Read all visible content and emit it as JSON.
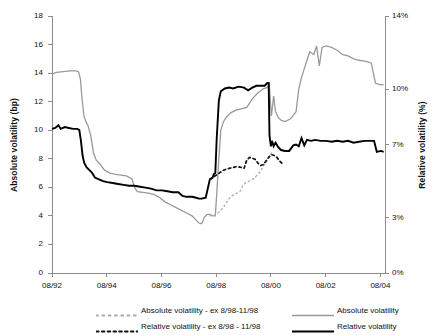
{
  "chart_data": {
    "type": "line",
    "title": "",
    "xlabel": "",
    "ylabel": "Absolute volatility (bp)",
    "y2label": "Relative volatility (%)",
    "grid": false,
    "legend_position": "bottom",
    "x_tick_labels": [
      "08/92",
      "08/94",
      "08/96",
      "08/98",
      "08/00",
      "08/02",
      "08/04"
    ],
    "x_tick_values": [
      1992.583,
      1994.583,
      1996.583,
      1998.583,
      2000.583,
      2002.583,
      2004.583
    ],
    "xlim": [
      1992.583,
      2004.75
    ],
    "y_left_tick_labels": [
      "0",
      "2",
      "4",
      "6",
      "8",
      "10",
      "12",
      "14",
      "16",
      "18"
    ],
    "y_left_tick_values": [
      0,
      2,
      4,
      6,
      8,
      10,
      12,
      14,
      16,
      18
    ],
    "ylim": [
      0,
      18
    ],
    "y_right_tick_labels": [
      "0%",
      "3%",
      "7%",
      "10%",
      "14%"
    ],
    "y_right_tick_values": [
      0,
      3,
      7,
      10,
      14
    ],
    "y2lim": [
      0,
      14
    ],
    "series": [
      {
        "name": "Absolute volatility",
        "axis": "left",
        "color": "#999999",
        "style": "solid",
        "width": 1.3,
        "points": [
          [
            1992.583,
            13.95
          ],
          [
            1992.75,
            14.05
          ],
          [
            1993.0,
            14.1
          ],
          [
            1993.25,
            14.15
          ],
          [
            1993.45,
            14.15
          ],
          [
            1993.55,
            14.1
          ],
          [
            1993.62,
            13.6
          ],
          [
            1993.68,
            12.2
          ],
          [
            1993.75,
            11.0
          ],
          [
            1993.82,
            10.6
          ],
          [
            1993.9,
            10.3
          ],
          [
            1994.0,
            9.6
          ],
          [
            1994.1,
            8.4
          ],
          [
            1994.2,
            7.9
          ],
          [
            1994.35,
            7.6
          ],
          [
            1994.5,
            7.2
          ],
          [
            1994.7,
            7.0
          ],
          [
            1994.9,
            6.9
          ],
          [
            1995.1,
            6.85
          ],
          [
            1995.3,
            6.8
          ],
          [
            1995.5,
            6.6
          ],
          [
            1995.6,
            6.0
          ],
          [
            1995.7,
            5.7
          ],
          [
            1995.9,
            5.65
          ],
          [
            1996.1,
            5.6
          ],
          [
            1996.3,
            5.5
          ],
          [
            1996.5,
            5.3
          ],
          [
            1996.7,
            5.0
          ],
          [
            1996.9,
            4.8
          ],
          [
            1997.1,
            4.6
          ],
          [
            1997.3,
            4.4
          ],
          [
            1997.5,
            4.2
          ],
          [
            1997.7,
            4.0
          ],
          [
            1997.85,
            3.7
          ],
          [
            1997.95,
            3.5
          ],
          [
            1998.05,
            3.45
          ],
          [
            1998.15,
            3.9
          ],
          [
            1998.25,
            4.1
          ],
          [
            1998.35,
            4.1
          ],
          [
            1998.45,
            4.0
          ],
          [
            1998.55,
            4.0
          ],
          [
            1998.6,
            5.5
          ],
          [
            1998.68,
            8.0
          ],
          [
            1998.75,
            10.0
          ],
          [
            1998.85,
            10.6
          ],
          [
            1998.95,
            10.9
          ],
          [
            1999.1,
            11.2
          ],
          [
            1999.3,
            11.4
          ],
          [
            1999.5,
            11.5
          ],
          [
            1999.7,
            11.6
          ],
          [
            1999.9,
            12.2
          ],
          [
            2000.1,
            12.6
          ],
          [
            2000.3,
            12.9
          ],
          [
            2000.45,
            13.0
          ],
          [
            2000.52,
            13.2
          ],
          [
            2000.6,
            11.0
          ],
          [
            2000.68,
            12.4
          ],
          [
            2000.75,
            11.3
          ],
          [
            2000.85,
            10.9
          ],
          [
            2000.95,
            10.7
          ],
          [
            2001.1,
            10.6
          ],
          [
            2001.3,
            10.8
          ],
          [
            2001.5,
            11.3
          ],
          [
            2001.6,
            12.9
          ],
          [
            2001.7,
            13.7
          ],
          [
            2001.85,
            14.6
          ],
          [
            2002.0,
            15.5
          ],
          [
            2002.15,
            15.3
          ],
          [
            2002.25,
            15.9
          ],
          [
            2002.35,
            14.5
          ],
          [
            2002.45,
            15.8
          ],
          [
            2002.6,
            15.9
          ],
          [
            2002.8,
            15.8
          ],
          [
            2003.0,
            15.6
          ],
          [
            2003.2,
            15.3
          ],
          [
            2003.4,
            15.2
          ],
          [
            2003.6,
            15.0
          ],
          [
            2003.8,
            14.9
          ],
          [
            2003.95,
            14.85
          ],
          [
            2004.1,
            14.8
          ],
          [
            2004.25,
            14.7
          ],
          [
            2004.4,
            13.3
          ],
          [
            2004.55,
            13.2
          ],
          [
            2004.7,
            13.2
          ]
        ]
      },
      {
        "name": "Relative volatility",
        "axis": "right",
        "color": "#000000",
        "style": "solid",
        "width": 1.9,
        "points": [
          [
            1992.583,
            7.85
          ],
          [
            1992.7,
            7.9
          ],
          [
            1992.82,
            8.05
          ],
          [
            1992.9,
            7.85
          ],
          [
            1993.05,
            7.95
          ],
          [
            1993.2,
            7.9
          ],
          [
            1993.35,
            7.85
          ],
          [
            1993.5,
            7.85
          ],
          [
            1993.58,
            7.8
          ],
          [
            1993.64,
            7.2
          ],
          [
            1993.7,
            6.4
          ],
          [
            1993.76,
            6.0
          ],
          [
            1993.85,
            5.75
          ],
          [
            1993.95,
            5.6
          ],
          [
            1994.05,
            5.45
          ],
          [
            1994.15,
            5.2
          ],
          [
            1994.3,
            5.1
          ],
          [
            1994.45,
            5.0
          ],
          [
            1994.6,
            4.95
          ],
          [
            1994.8,
            4.9
          ],
          [
            1995.0,
            4.85
          ],
          [
            1995.2,
            4.8
          ],
          [
            1995.4,
            4.75
          ],
          [
            1995.6,
            4.75
          ],
          [
            1995.8,
            4.7
          ],
          [
            1996.0,
            4.65
          ],
          [
            1996.2,
            4.6
          ],
          [
            1996.4,
            4.5
          ],
          [
            1996.6,
            4.5
          ],
          [
            1996.8,
            4.45
          ],
          [
            1997.0,
            4.4
          ],
          [
            1997.2,
            4.4
          ],
          [
            1997.35,
            4.2
          ],
          [
            1997.5,
            4.15
          ],
          [
            1997.7,
            4.15
          ],
          [
            1997.85,
            4.1
          ],
          [
            1997.95,
            4.05
          ],
          [
            1998.05,
            4.05
          ],
          [
            1998.2,
            4.1
          ],
          [
            1998.35,
            5.1
          ],
          [
            1998.45,
            5.2
          ],
          [
            1998.5,
            5.4
          ],
          [
            1998.55,
            5.45
          ],
          [
            1998.6,
            7.3
          ],
          [
            1998.68,
            9.4
          ],
          [
            1998.75,
            9.9
          ],
          [
            1998.9,
            10.05
          ],
          [
            1999.05,
            10.1
          ],
          [
            1999.2,
            10.05
          ],
          [
            1999.4,
            10.15
          ],
          [
            1999.6,
            10.1
          ],
          [
            1999.75,
            9.95
          ],
          [
            1999.9,
            10.1
          ],
          [
            2000.05,
            10.2
          ],
          [
            2000.2,
            10.2
          ],
          [
            2000.35,
            10.2
          ],
          [
            2000.45,
            10.35
          ],
          [
            2000.5,
            10.35
          ],
          [
            2000.53,
            7.5
          ],
          [
            2000.58,
            6.9
          ],
          [
            2000.62,
            7.2
          ],
          [
            2000.68,
            6.9
          ],
          [
            2000.75,
            7.1
          ],
          [
            2000.85,
            6.85
          ],
          [
            2000.95,
            6.7
          ],
          [
            2001.1,
            6.65
          ],
          [
            2001.25,
            6.65
          ],
          [
            2001.4,
            6.95
          ],
          [
            2001.5,
            7.0
          ],
          [
            2001.6,
            6.9
          ],
          [
            2001.7,
            7.35
          ],
          [
            2001.8,
            6.95
          ],
          [
            2001.9,
            7.25
          ],
          [
            2002.05,
            7.2
          ],
          [
            2002.2,
            7.25
          ],
          [
            2002.4,
            7.2
          ],
          [
            2002.6,
            7.2
          ],
          [
            2002.8,
            7.15
          ],
          [
            2003.0,
            7.2
          ],
          [
            2003.2,
            7.15
          ],
          [
            2003.4,
            7.2
          ],
          [
            2003.6,
            7.1
          ],
          [
            2003.8,
            7.15
          ],
          [
            2004.0,
            7.2
          ],
          [
            2004.2,
            7.2
          ],
          [
            2004.35,
            7.2
          ],
          [
            2004.45,
            6.6
          ],
          [
            2004.6,
            6.65
          ],
          [
            2004.7,
            6.6
          ]
        ]
      },
      {
        "name": "Absolute volatility - ex 8/98-11/98",
        "axis": "left",
        "color": "#aaaaaa",
        "style": "dotted",
        "width": 1.3,
        "points": [
          [
            1998.35,
            4.0
          ],
          [
            1998.45,
            4.05
          ],
          [
            1998.55,
            4.05
          ],
          [
            1998.65,
            4.2
          ],
          [
            1998.75,
            4.4
          ],
          [
            1998.85,
            4.6
          ],
          [
            1998.95,
            4.9
          ],
          [
            1999.05,
            5.2
          ],
          [
            1999.15,
            5.4
          ],
          [
            1999.25,
            5.5
          ],
          [
            1999.35,
            5.6
          ],
          [
            1999.45,
            5.7
          ],
          [
            1999.55,
            6.1
          ],
          [
            1999.65,
            6.3
          ],
          [
            1999.75,
            6.4
          ],
          [
            1999.85,
            6.5
          ],
          [
            1999.95,
            6.6
          ],
          [
            2000.05,
            6.8
          ],
          [
            2000.15,
            7.0
          ],
          [
            2000.25,
            7.3
          ],
          [
            2000.35,
            7.6
          ],
          [
            2000.45,
            7.9
          ],
          [
            2000.52,
            8.2
          ],
          [
            2000.6,
            8.4
          ]
        ]
      },
      {
        "name": "Relative volatility - ex 8/98 - 11/98",
        "axis": "right",
        "color": "#111111",
        "style": "dashed",
        "width": 1.7,
        "points": [
          [
            1998.35,
            5.1
          ],
          [
            1998.45,
            5.2
          ],
          [
            1998.55,
            5.3
          ],
          [
            1998.65,
            5.4
          ],
          [
            1998.75,
            5.5
          ],
          [
            1998.85,
            5.6
          ],
          [
            1998.95,
            5.65
          ],
          [
            1999.05,
            5.7
          ],
          [
            1999.2,
            5.75
          ],
          [
            1999.35,
            5.8
          ],
          [
            1999.5,
            5.75
          ],
          [
            1999.6,
            5.7
          ],
          [
            1999.7,
            6.15
          ],
          [
            1999.8,
            6.3
          ],
          [
            1999.9,
            6.25
          ],
          [
            2000.0,
            6.2
          ],
          [
            2000.1,
            6.0
          ],
          [
            2000.2,
            5.85
          ],
          [
            2000.3,
            5.9
          ],
          [
            2000.4,
            6.1
          ],
          [
            2000.5,
            6.3
          ],
          [
            2000.6,
            6.45
          ],
          [
            2000.7,
            6.4
          ],
          [
            2000.8,
            6.3
          ],
          [
            2000.9,
            6.1
          ],
          [
            2001.0,
            5.95
          ]
        ]
      }
    ]
  },
  "axes": {
    "left_title": "Absolute volatility (bp)",
    "right_title": "Relative volatility (%)"
  },
  "legend": {
    "items": [
      {
        "label": "Absolute volatility - ex 8/98-11/98",
        "style": "dotted",
        "color": "#aaaaaa",
        "row": 0,
        "col": 0
      },
      {
        "label": "Absolute volatility",
        "style": "solid",
        "color": "#999999",
        "row": 0,
        "col": 1
      },
      {
        "label": "Relative volatility - ex 8/98 - 11/98",
        "style": "dashed",
        "color": "#111111",
        "row": 1,
        "col": 0
      },
      {
        "label": "Relative volatility",
        "style": "solid",
        "color": "#000000",
        "row": 1,
        "col": 1
      }
    ]
  }
}
